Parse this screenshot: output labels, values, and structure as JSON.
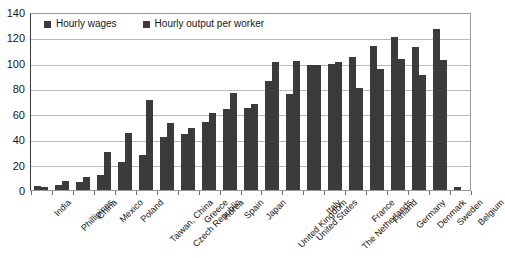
{
  "chart_data": {
    "type": "bar",
    "title": "",
    "subtitle": "",
    "xlabel": "",
    "ylabel": "",
    "ylim": [
      0,
      140
    ],
    "yticks": [
      0,
      20,
      40,
      60,
      80,
      100,
      120,
      140
    ],
    "grid": true,
    "legend_position": "top-left",
    "bar_color": "#3b3b3b",
    "categories": [
      "India",
      "Phillipines",
      "China",
      "Mexico",
      "Poland",
      "Taiwan, China",
      "Czech Republic",
      "Greece",
      "Korea",
      "Spain",
      "Japan",
      "United Kingdom",
      "United States",
      "Italy",
      "The Netherlands",
      "France",
      "Finland",
      "Germany",
      "Denmark",
      "Sweden",
      "Belgium"
    ],
    "series": [
      {
        "name": "Hourly wages",
        "values": [
          3,
          4,
          6,
          12,
          22,
          28,
          42,
          44,
          54,
          64,
          65,
          86,
          76,
          99,
          100,
          105,
          114,
          121,
          113,
          127,
          2
        ]
      },
      {
        "name": "Hourly output per worker",
        "values": [
          2,
          7,
          10,
          30,
          45,
          71,
          53,
          49,
          61,
          77,
          68,
          101,
          102,
          99,
          101,
          81,
          96,
          104,
          91,
          103,
          0
        ]
      }
    ],
    "series_layout_note": "two bars per category, wages left, output right"
  },
  "legend": {
    "entries": [
      {
        "label": "Hourly wages",
        "color": "#3b3b3b"
      },
      {
        "label": "Hourly output per worker",
        "color": "#3b3b3b"
      }
    ]
  },
  "axis": {
    "y_tick_labels": [
      "140",
      "120",
      "100",
      "80",
      "60",
      "40",
      "20",
      "0"
    ]
  }
}
